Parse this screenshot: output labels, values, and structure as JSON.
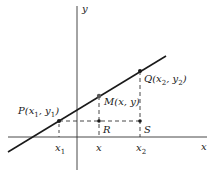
{
  "diagram": {
    "type": "coordinate-geometry",
    "axes": {
      "x_label": "x",
      "y_label": "y"
    },
    "points": {
      "P": {
        "name": "P",
        "coords": "(x1, y1)",
        "label_main": "P(x",
        "sub1": "1",
        "mid": ", y",
        "sub2": "1",
        "end": ")"
      },
      "M": {
        "name": "M",
        "coords": "(x, y)",
        "label": "M(x, y)"
      },
      "Q": {
        "name": "Q",
        "coords": "(x2, y2)",
        "label_main": "Q(x",
        "sub1": "2",
        "mid": ", y",
        "sub2": "2",
        "end": ")"
      },
      "R": {
        "name": "R",
        "label": "R"
      },
      "S": {
        "name": "S",
        "label": "S"
      }
    },
    "ticks": [
      {
        "label": "x",
        "sub": "1"
      },
      {
        "label": "x",
        "sub": ""
      },
      {
        "label": "x",
        "sub": "2"
      }
    ],
    "colors": {
      "line": "#1a1a1a",
      "axis": "#333333",
      "dashed": "#333333",
      "background": "#ffffff"
    }
  }
}
